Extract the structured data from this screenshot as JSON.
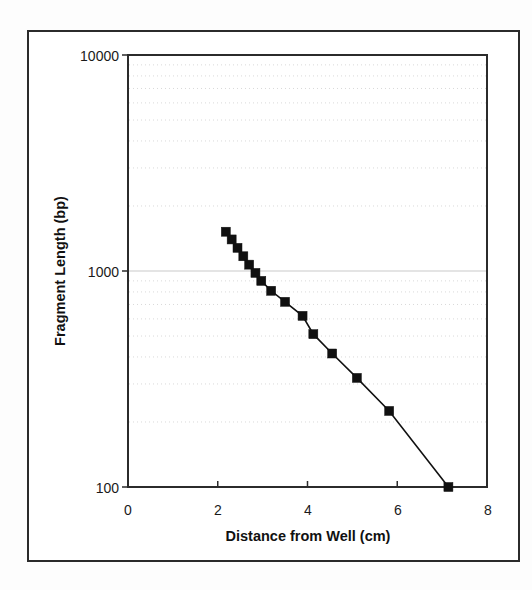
{
  "figure": {
    "kind": "scientific-line-chart",
    "background_color": "#ffffff",
    "frame_color": "#2b2b2b",
    "series_color": "#101010",
    "grid_color": "#d9d9d9"
  },
  "axes": {
    "y_title": "Fragment Length (bp)",
    "x_title": "Distance from Well (cm)",
    "y_ticks": [
      "10000",
      "1000",
      "100"
    ],
    "x_ticks": [
      "0",
      "2",
      "4",
      "6",
      "8"
    ]
  },
  "chart_data": {
    "type": "line",
    "title": "",
    "subtitle": "",
    "xlabel": "Distance from Well (cm)",
    "ylabel": "Fragment Length (bp)",
    "xscale": "linear",
    "yscale": "log",
    "xlim": [
      0,
      8
    ],
    "ylim": [
      100,
      10000
    ],
    "xticks": [
      0,
      2,
      4,
      6,
      8
    ],
    "yticks": [
      100,
      1000,
      10000
    ],
    "ytick_labels": [
      "100",
      "1000",
      "10000"
    ],
    "grid": true,
    "grid_style": "dotted-minor-log",
    "legend": false,
    "legend_position": "none",
    "marker": "filled-square",
    "series": [
      {
        "name": "DNA ladder migration",
        "x": [
          2.18,
          2.31,
          2.44,
          2.57,
          2.7,
          2.84,
          2.97,
          3.19,
          3.5,
          3.89,
          4.13,
          4.55,
          5.1,
          5.82,
          7.14
        ],
        "y": [
          1520,
          1400,
          1280,
          1170,
          1070,
          980,
          900,
          810,
          720,
          620,
          510,
          415,
          320,
          225,
          100
        ]
      }
    ]
  }
}
